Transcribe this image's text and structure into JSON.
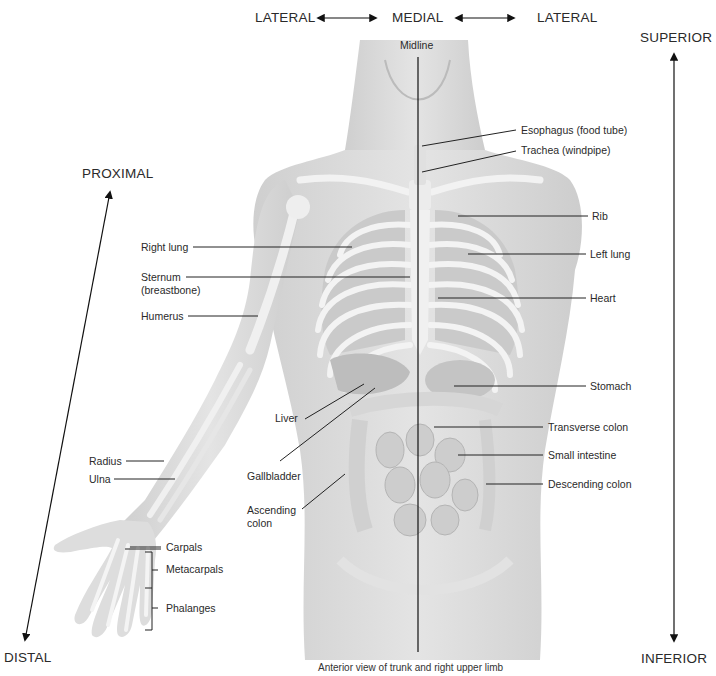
{
  "directions": {
    "lateral_left": "LATERAL",
    "medial": "MEDIAL",
    "lateral_right": "LATERAL",
    "superior": "SUPERIOR",
    "inferior": "INFERIOR",
    "proximal": "PROXIMAL",
    "distal": "DISTAL",
    "midline": "Midline"
  },
  "labels_left": {
    "right_lung": "Right lung",
    "sternum_1": "Sternum",
    "sternum_2": "(breastbone)",
    "humerus": "Humerus",
    "liver": "Liver",
    "radius": "Radius",
    "ulna": "Ulna",
    "gallbladder": "Gallbladder",
    "ascending_colon_1": "Ascending",
    "ascending_colon_2": "colon",
    "carpals": "Carpals",
    "metacarpals": "Metacarpals",
    "phalanges": "Phalanges"
  },
  "labels_right": {
    "esophagus": "Esophagus (food tube)",
    "trachea": "Trachea (windpipe)",
    "rib": "Rib",
    "left_lung": "Left lung",
    "heart": "Heart",
    "stomach": "Stomach",
    "transverse_colon": "Transverse colon",
    "small_intestine": "Small intestine",
    "descending_colon": "Descending colon"
  },
  "caption": "Anterior view of trunk and right upper limb",
  "colors": {
    "skin": "#d9d9d9",
    "bone": "#f2f2f2",
    "organ": "#bdbdbd",
    "leader": "#222222"
  }
}
